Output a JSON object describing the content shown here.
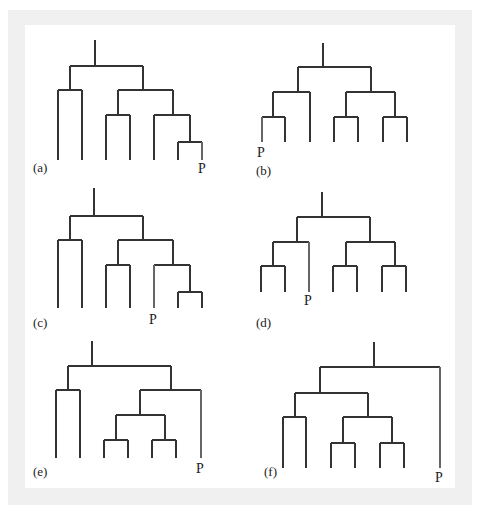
{
  "figure": {
    "colors": {
      "line": "#333333",
      "p_line": "#666666",
      "frame": "#f0f0f0",
      "panel": "#ffffff",
      "text": "#222222"
    },
    "trees": [
      {
        "id": "a",
        "label": "(a)",
        "label_pos": [
          33,
          172
        ],
        "p_label": "P",
        "p_label_pos": [
          198,
          173
        ],
        "segments": [
          [
            95,
            40,
            95,
            66
          ],
          [
            70,
            66,
            143,
            66
          ],
          [
            70,
            66,
            70,
            90
          ],
          [
            58,
            90,
            82,
            90
          ],
          [
            58,
            90,
            58,
            160
          ],
          [
            82,
            90,
            82,
            160
          ],
          [
            143,
            66,
            143,
            90
          ],
          [
            118,
            90,
            173,
            90
          ],
          [
            118,
            90,
            118,
            115
          ],
          [
            106,
            115,
            130,
            115
          ],
          [
            106,
            115,
            106,
            160
          ],
          [
            130,
            115,
            130,
            160
          ],
          [
            173,
            90,
            173,
            115
          ],
          [
            154,
            115,
            190,
            115
          ],
          [
            154,
            115,
            154,
            160
          ],
          [
            190,
            115,
            190,
            142
          ],
          [
            178,
            142,
            202,
            142
          ],
          [
            178,
            142,
            178,
            160
          ]
        ],
        "p_segments": [
          [
            202,
            142,
            202,
            160
          ]
        ]
      },
      {
        "id": "b",
        "label": "(b)",
        "label_pos": [
          256,
          175
        ],
        "p_label": "P",
        "p_label_pos": [
          257,
          157
        ],
        "segments": [
          [
            323,
            43,
            323,
            67
          ],
          [
            298,
            67,
            371,
            67
          ],
          [
            298,
            67,
            298,
            92
          ],
          [
            273,
            92,
            310,
            92
          ],
          [
            310,
            92,
            310,
            142
          ],
          [
            273,
            92,
            273,
            117
          ],
          [
            262,
            117,
            285,
            117
          ],
          [
            285,
            117,
            285,
            142
          ],
          [
            371,
            67,
            371,
            92
          ],
          [
            346,
            92,
            395,
            92
          ],
          [
            346,
            92,
            346,
            117
          ],
          [
            334,
            117,
            358,
            117
          ],
          [
            334,
            117,
            334,
            142
          ],
          [
            358,
            117,
            358,
            142
          ],
          [
            395,
            92,
            395,
            117
          ],
          [
            383,
            117,
            407,
            117
          ],
          [
            383,
            117,
            383,
            142
          ],
          [
            407,
            117,
            407,
            142
          ]
        ],
        "p_segments": [
          [
            262,
            117,
            262,
            142
          ]
        ]
      },
      {
        "id": "c",
        "label": "(c)",
        "label_pos": [
          33,
          327
        ],
        "p_label": "P",
        "p_label_pos": [
          149,
          324
        ],
        "segments": [
          [
            94,
            188,
            94,
            216
          ],
          [
            70,
            216,
            143,
            216
          ],
          [
            70,
            216,
            70,
            240
          ],
          [
            58,
            240,
            82,
            240
          ],
          [
            58,
            240,
            58,
            308
          ],
          [
            82,
            240,
            82,
            308
          ],
          [
            143,
            216,
            143,
            240
          ],
          [
            118,
            240,
            173,
            240
          ],
          [
            118,
            240,
            118,
            265
          ],
          [
            106,
            265,
            130,
            265
          ],
          [
            106,
            265,
            106,
            308
          ],
          [
            130,
            265,
            130,
            308
          ],
          [
            173,
            240,
            173,
            265
          ],
          [
            154,
            265,
            190,
            265
          ],
          [
            190,
            265,
            190,
            292
          ],
          [
            178,
            292,
            202,
            292
          ],
          [
            178,
            292,
            178,
            308
          ],
          [
            202,
            292,
            202,
            308
          ]
        ],
        "p_segments": [
          [
            154,
            265,
            154,
            308
          ]
        ]
      },
      {
        "id": "d",
        "label": "(d)",
        "label_pos": [
          256,
          327
        ],
        "p_label": "P",
        "p_label_pos": [
          304,
          305
        ],
        "segments": [
          [
            322,
            192,
            322,
            217
          ],
          [
            297,
            217,
            370,
            217
          ],
          [
            297,
            217,
            297,
            242
          ],
          [
            273,
            242,
            309,
            242
          ],
          [
            273,
            242,
            273,
            266
          ],
          [
            261,
            266,
            285,
            266
          ],
          [
            261,
            266,
            261,
            292
          ],
          [
            285,
            266,
            285,
            292
          ],
          [
            370,
            217,
            370,
            242
          ],
          [
            346,
            242,
            395,
            242
          ],
          [
            346,
            242,
            346,
            266
          ],
          [
            333,
            266,
            357,
            266
          ],
          [
            333,
            266,
            333,
            292
          ],
          [
            357,
            266,
            357,
            292
          ],
          [
            395,
            242,
            395,
            266
          ],
          [
            382,
            266,
            406,
            266
          ],
          [
            382,
            266,
            382,
            292
          ],
          [
            406,
            266,
            406,
            292
          ]
        ],
        "p_segments": [
          [
            309,
            242,
            309,
            292
          ]
        ]
      },
      {
        "id": "e",
        "label": "(e)",
        "label_pos": [
          33,
          476
        ],
        "p_label": "P",
        "p_label_pos": [
          196,
          473
        ],
        "segments": [
          [
            92,
            341,
            92,
            366
          ],
          [
            68,
            366,
            171,
            366
          ],
          [
            68,
            366,
            68,
            390
          ],
          [
            56,
            390,
            80,
            390
          ],
          [
            56,
            390,
            56,
            458
          ],
          [
            80,
            390,
            80,
            458
          ],
          [
            171,
            366,
            171,
            390
          ],
          [
            140,
            390,
            201,
            390
          ],
          [
            140,
            390,
            140,
            415
          ],
          [
            116,
            415,
            165,
            415
          ],
          [
            116,
            415,
            116,
            440
          ],
          [
            104,
            440,
            128,
            440
          ],
          [
            104,
            440,
            104,
            458
          ],
          [
            128,
            440,
            128,
            458
          ],
          [
            165,
            415,
            165,
            440
          ],
          [
            152,
            440,
            176,
            440
          ],
          [
            152,
            440,
            152,
            458
          ],
          [
            176,
            440,
            176,
            458
          ]
        ],
        "p_segments": [
          [
            201,
            390,
            201,
            458
          ]
        ]
      },
      {
        "id": "f",
        "label": "(f)",
        "label_pos": [
          264,
          476
        ],
        "p_label": "P",
        "p_label_pos": [
          435,
          482
        ],
        "segments": [
          [
            374,
            342,
            374,
            367
          ],
          [
            320,
            367,
            440,
            367
          ],
          [
            320,
            367,
            320,
            393
          ],
          [
            295,
            393,
            368,
            393
          ],
          [
            295,
            393,
            295,
            417
          ],
          [
            283,
            417,
            306,
            417
          ],
          [
            283,
            417,
            283,
            468
          ],
          [
            306,
            417,
            306,
            468
          ],
          [
            368,
            393,
            368,
            417
          ],
          [
            343,
            417,
            392,
            417
          ],
          [
            343,
            417,
            343,
            443
          ],
          [
            331,
            443,
            355,
            443
          ],
          [
            331,
            443,
            331,
            468
          ],
          [
            355,
            443,
            355,
            468
          ],
          [
            392,
            417,
            392,
            443
          ],
          [
            380,
            443,
            404,
            443
          ],
          [
            380,
            443,
            380,
            468
          ],
          [
            404,
            443,
            404,
            468
          ]
        ],
        "p_segments": [
          [
            440,
            367,
            440,
            468
          ]
        ]
      }
    ]
  }
}
